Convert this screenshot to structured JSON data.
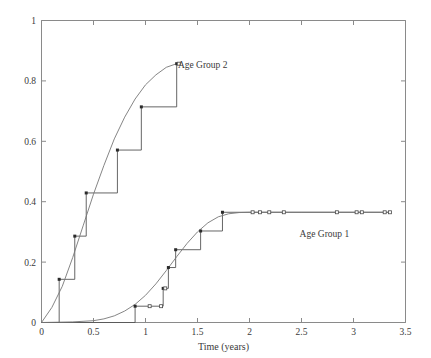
{
  "chart_data": {
    "type": "line",
    "title": "",
    "xlabel": "Time (years)",
    "ylabel": "",
    "xlim": [
      0,
      3.5
    ],
    "ylim": [
      0,
      1
    ],
    "grid": false,
    "legend_position": "inline-annotations",
    "xticks": [
      "0",
      "0.5",
      "1",
      "1.5",
      "2",
      "2.5",
      "3",
      "3.5"
    ],
    "xtick_values": [
      0,
      0.5,
      1,
      1.5,
      2,
      2.5,
      3,
      3.5
    ],
    "yticks": [
      "0",
      "0.2",
      "0.4",
      "0.6",
      "0.8",
      "1"
    ],
    "ytick_values": [
      0,
      0.2,
      0.4,
      0.6,
      0.8,
      1.0
    ],
    "annotations": [
      {
        "text": "Age Group 2",
        "x": 1.55,
        "y": 0.855
      },
      {
        "text": "Age Group 1",
        "x": 2.72,
        "y": 0.295
      }
    ],
    "series": [
      {
        "name": "Age Group 2",
        "style": "step-post",
        "marker": "filled-square",
        "color": "#555555",
        "x": [
          0.0,
          0.17,
          0.32,
          0.43,
          0.73,
          0.96,
          1.3
        ],
        "y": [
          0.0,
          0.143,
          0.286,
          0.429,
          0.571,
          0.714,
          0.857
        ],
        "censored_x": [
          1.32
        ],
        "censored_y": [
          0.857
        ]
      },
      {
        "name": "Age Group 2 smooth fit",
        "style": "smooth",
        "color": "#777777",
        "x": [
          0.0,
          0.1,
          0.2,
          0.3,
          0.4,
          0.5,
          0.6,
          0.7,
          0.8,
          0.9,
          1.0,
          1.1,
          1.2,
          1.3
        ],
        "y": [
          0.0,
          0.05,
          0.12,
          0.215,
          0.32,
          0.425,
          0.52,
          0.608,
          0.68,
          0.74,
          0.787,
          0.82,
          0.845,
          0.857
        ]
      },
      {
        "name": "Age Group 1",
        "style": "step-post",
        "marker": "filled-square",
        "color": "#555555",
        "x": [
          0.0,
          0.9,
          1.17,
          1.22,
          1.29,
          1.53,
          1.74
        ],
        "y": [
          0.0,
          0.054,
          0.113,
          0.182,
          0.241,
          0.303,
          0.365
        ],
        "censored_x": [
          1.04,
          1.15,
          1.19,
          2.03,
          2.1,
          2.19,
          2.33,
          2.84,
          3.03,
          3.08,
          3.3,
          3.35
        ],
        "censored_y": [
          0.054,
          0.054,
          0.113,
          0.365,
          0.365,
          0.365,
          0.365,
          0.365,
          0.365,
          0.365,
          0.365,
          0.365
        ]
      },
      {
        "name": "Age Group 1 smooth fit",
        "style": "smooth",
        "color": "#777777",
        "x": [
          0.0,
          0.3,
          0.5,
          0.6,
          0.7,
          0.8,
          0.9,
          1.0,
          1.1,
          1.2,
          1.3,
          1.4,
          1.5,
          1.6,
          1.7,
          1.8,
          1.9,
          2.0,
          2.5,
          3.0,
          3.35
        ],
        "y": [
          0.0,
          0.002,
          0.006,
          0.012,
          0.022,
          0.038,
          0.06,
          0.09,
          0.128,
          0.172,
          0.218,
          0.262,
          0.3,
          0.33,
          0.35,
          0.36,
          0.364,
          0.365,
          0.365,
          0.365,
          0.365
        ]
      }
    ]
  },
  "axis": {
    "x_title": "Time (years)"
  }
}
